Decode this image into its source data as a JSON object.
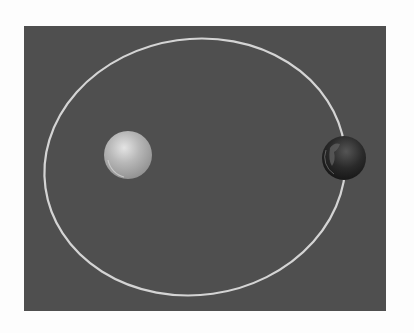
{
  "diagram": {
    "background_color": "#4f4f4f",
    "page_color": "#fdfdfd",
    "orbit": {
      "shape": "ellipse",
      "cx": 195,
      "cy": 167,
      "rx": 151,
      "ry": 128,
      "rotation_deg": -8,
      "stroke": "#d4d4d4",
      "stroke_width": 2.2
    },
    "bodies": [
      {
        "name": "central-star",
        "label": "Sun",
        "cx": 128,
        "cy": 155,
        "r": 24,
        "color": "#b4b4b4",
        "highlight": "#e2e2e2"
      },
      {
        "name": "planet",
        "label": "Earth",
        "cx": 344,
        "cy": 158,
        "r": 22,
        "color": "#1e1e1e",
        "highlight": "#7a7a7a"
      }
    ]
  }
}
